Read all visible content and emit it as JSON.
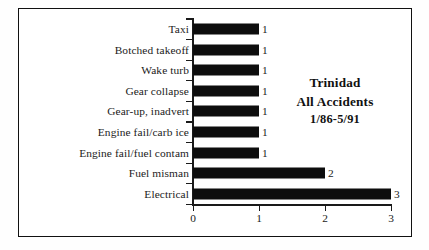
{
  "chart_data": {
    "type": "bar",
    "orientation": "horizontal",
    "title": "Trinidad All Accidents 1/86-5/91",
    "title_lines": [
      "Trinidad",
      "All Accidents",
      "1/86-5/91"
    ],
    "xlabel": "",
    "ylabel": "",
    "xlim": [
      0,
      3
    ],
    "xticks": [
      "0",
      "1",
      "2",
      "3"
    ],
    "grid": false,
    "legend": false,
    "categories": [
      "Taxi",
      "Botched takeoff",
      "Wake turb",
      "Gear collapse",
      "Gear-up, inadvert",
      "Engine fail/carb ice",
      "Engine fail/fuel contam",
      "Fuel misman",
      "Electrical"
    ],
    "values": [
      1,
      1,
      1,
      1,
      1,
      1,
      1,
      2,
      3
    ],
    "data_labels": [
      "1",
      "1",
      "1",
      "1",
      "1",
      "1",
      "1",
      "2",
      "3"
    ],
    "bar_color": "#0d0d0d",
    "axis_color": "#1a1a1a",
    "background": "#ffffff"
  }
}
